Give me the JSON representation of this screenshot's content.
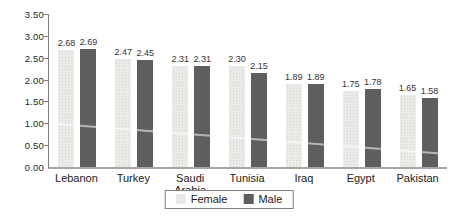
{
  "chart_data": {
    "type": "bar",
    "title": "",
    "xlabel": "",
    "ylabel": "",
    "categories": [
      "Lebanon",
      "Turkey",
      "Saudi Arabia",
      "Tunisia",
      "Iraq",
      "Egypt",
      "Pakistan"
    ],
    "series": [
      {
        "name": "Female",
        "color": "#eaeae7",
        "values": [
          2.68,
          2.47,
          2.31,
          2.3,
          1.89,
          1.75,
          1.65
        ],
        "value_labels": [
          "2.68",
          "2.47",
          "2.31",
          "2.30",
          "1.89",
          "1.75",
          "1.65"
        ]
      },
      {
        "name": "Male",
        "color": "#5e5e5e",
        "values": [
          2.69,
          2.45,
          2.31,
          2.15,
          1.89,
          1.78,
          1.58
        ],
        "value_labels": [
          "2.69",
          "2.45",
          "2.31",
          "2.15",
          "1.89",
          "1.78",
          "1.58"
        ]
      }
    ],
    "ylim": [
      0,
      3.5
    ],
    "ytick_step": 0.5,
    "ytick_labels": [
      "3.50",
      "3.00",
      "2.50",
      "2.00",
      "1.50",
      "1.00",
      "0.50",
      "0.00"
    ],
    "grid": false,
    "legend_position": "bottom-center",
    "value_labels_shown": true
  },
  "legend": {
    "items": [
      {
        "label": "Female",
        "color": "#eaeae7"
      },
      {
        "label": "Male",
        "color": "#5e5e5e"
      }
    ]
  }
}
